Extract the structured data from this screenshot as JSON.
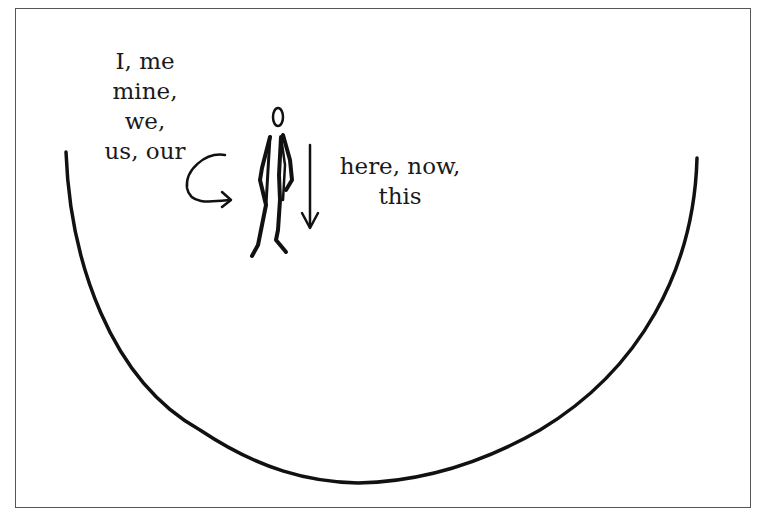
{
  "diagram": {
    "labels": {
      "pronouns": [
        "I, me",
        "mine, we,",
        "us, our"
      ],
      "deixis": [
        "here, now,",
        "this"
      ]
    },
    "elements": {
      "figure": "stick-figure-person",
      "curved_arrow": "curved-arrow-pointing-to-self",
      "down_arrow": "down-arrow",
      "bowl": "semicircle-bowl-curve"
    },
    "colors": {
      "ink": "#111111",
      "frame": "#555555",
      "background": "#ffffff"
    }
  }
}
